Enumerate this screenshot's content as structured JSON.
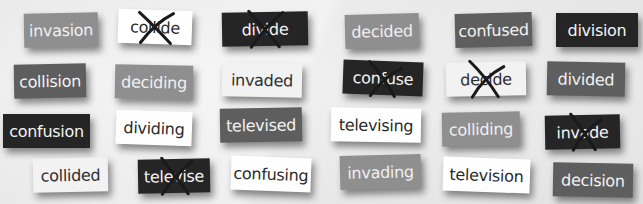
{
  "colors": {
    "background": "#ececec",
    "white": "#ffffff",
    "light": "#f2f2f2",
    "gray": "#8f8f8f",
    "mid": "#5e5e5e",
    "dark": "#252525",
    "cross_stroke": "#1a1a1a"
  },
  "cards": [
    {
      "word": "invasion",
      "tone": "gray",
      "crossed": false
    },
    {
      "word": "collide",
      "tone": "white",
      "crossed": true
    },
    {
      "word": "divide",
      "tone": "dark",
      "crossed": true
    },
    {
      "word": "decided",
      "tone": "gray",
      "crossed": false
    },
    {
      "word": "confused",
      "tone": "mid",
      "crossed": false
    },
    {
      "word": "division",
      "tone": "dark",
      "crossed": false
    },
    {
      "word": "collision",
      "tone": "mid",
      "crossed": false
    },
    {
      "word": "deciding",
      "tone": "gray",
      "crossed": false
    },
    {
      "word": "invaded",
      "tone": "light",
      "crossed": false
    },
    {
      "word": "confuse",
      "tone": "dark",
      "crossed": true
    },
    {
      "word": "decide",
      "tone": "light",
      "crossed": true
    },
    {
      "word": "divided",
      "tone": "mid",
      "crossed": false
    },
    {
      "word": "confusion",
      "tone": "dark",
      "crossed": false
    },
    {
      "word": "dividing",
      "tone": "white",
      "crossed": false
    },
    {
      "word": "televised",
      "tone": "mid",
      "crossed": false
    },
    {
      "word": "televising",
      "tone": "white",
      "crossed": false
    },
    {
      "word": "colliding",
      "tone": "gray",
      "crossed": false
    },
    {
      "word": "invade",
      "tone": "dark",
      "crossed": true
    },
    {
      "word": "collided",
      "tone": "light",
      "crossed": false
    },
    {
      "word": "televise",
      "tone": "dark",
      "crossed": true
    },
    {
      "word": "confusing",
      "tone": "white",
      "crossed": false
    },
    {
      "word": "invading",
      "tone": "gray",
      "crossed": false
    },
    {
      "word": "television",
      "tone": "white",
      "crossed": false
    },
    {
      "word": "decision",
      "tone": "mid",
      "crossed": false
    }
  ]
}
